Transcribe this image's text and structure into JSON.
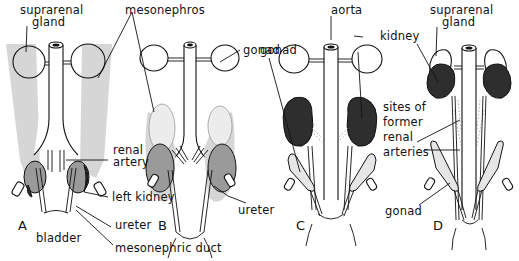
{
  "figure": {
    "type": "anatomical-diagram",
    "colors": {
      "mesonephros_fill": "#d6d6d6",
      "kidney_light": "#9a9a9a",
      "kidney_dark": "#2e2e2e",
      "gonad_light": "#e4e4e4",
      "outline": "#111111",
      "background": "#ffffff"
    },
    "panels": [
      {
        "letter": "A"
      },
      {
        "letter": "B"
      },
      {
        "letter": "C"
      },
      {
        "letter": "D"
      }
    ],
    "labels": {
      "suprarenal_gland_a": [
        "suprarenal",
        "gland"
      ],
      "mesonephros": "mesonephros",
      "renal_artery": [
        "renal",
        "artery"
      ],
      "left_kidney": "left kidney",
      "ureter_a": "ureter",
      "bladder": "bladder",
      "mesonephric_duct": "mesonephric duct",
      "gonad_b": "gonad",
      "ureter_b": "ureter",
      "aorta": "aorta",
      "kidney_c": "kidney",
      "gonad_c": "gonad",
      "suprarenal_gland_d": [
        "suprarenal",
        "gland"
      ],
      "sites_of_former_renal_arteries": [
        "sites of",
        "former",
        "renal",
        "arteries"
      ],
      "gonad_d": "gonad"
    }
  }
}
